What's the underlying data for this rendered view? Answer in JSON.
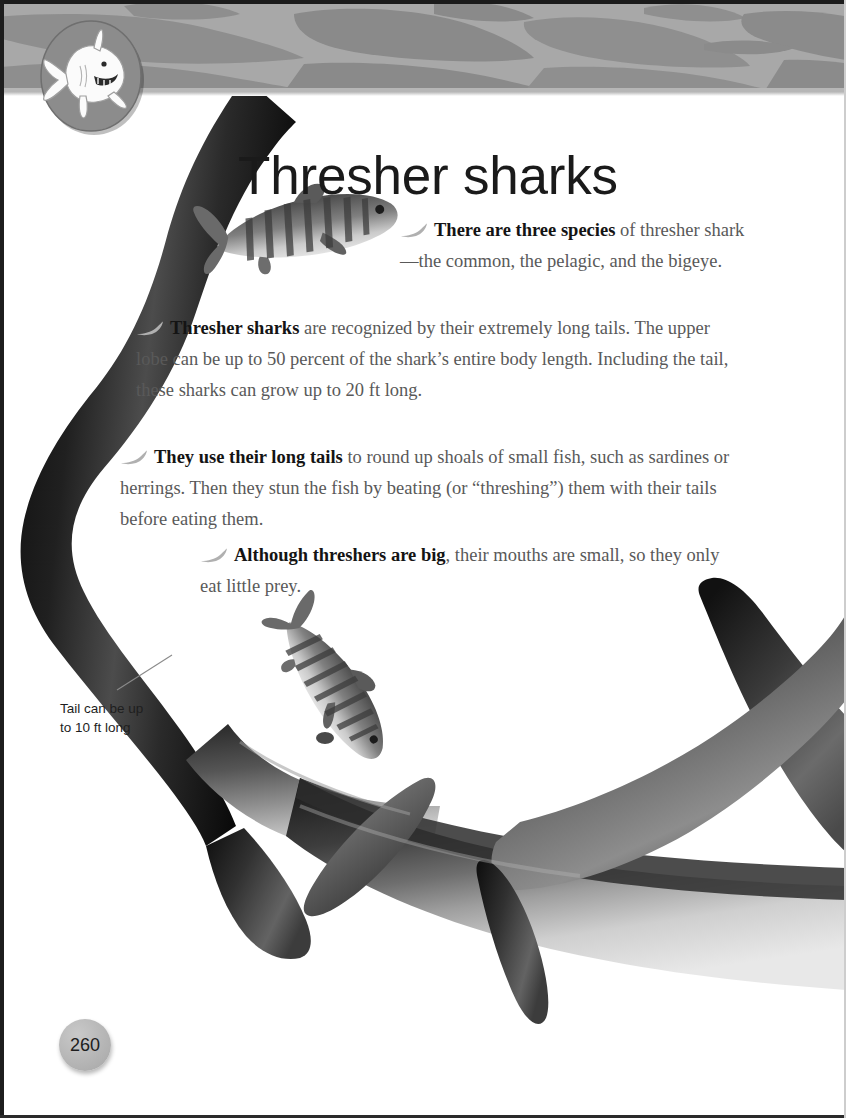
{
  "page": {
    "title": "Thresher sharks",
    "number": "260",
    "background_color": "#ffffff",
    "banner_color": "#a5a5a5",
    "body_text_color": "#595959",
    "lead_in_color": "#141414"
  },
  "mascot": {
    "icon": "cartoon-shark-icon",
    "badge_color": "#8c8c8c"
  },
  "bullets": [
    {
      "id": "bullet-species",
      "marker": "shark-fin-bullet",
      "lead_in": "There are three species",
      "text": " of thresher shark—the common, the pelagic, and the bigeye."
    },
    {
      "id": "bullet-long-tails",
      "marker": "shark-fin-bullet",
      "lead_in": "Thresher sharks",
      "text": " are recognized by their extremely long tails. The upper lobe can be up to 50 percent of the shark’s entire body length. Including the tail, these sharks can grow up to 20 ft long."
    },
    {
      "id": "bullet-hunting",
      "marker": "shark-fin-bullet",
      "lead_in": "They use their long tails",
      "text": " to round up shoals of small fish, such as sardines or herrings. Then they stun the fish by beating (or “threshing”) them with their tails before eating them."
    },
    {
      "id": "bullet-mouths",
      "marker": "shark-fin-bullet",
      "lead_in": "Although threshers are big",
      "text": ", their mouths are small, so they only eat little prey."
    }
  ],
  "caption": {
    "id": "tail-length-caption",
    "text": "Tail can be up\nto 10 ft long"
  },
  "artwork": {
    "main_subject": "thresher-shark-photo",
    "prey_fish_upper": "striped-prey-fish",
    "prey_fish_lower": "striped-prey-fish",
    "banner_silhouettes": "shark-silhouettes"
  }
}
